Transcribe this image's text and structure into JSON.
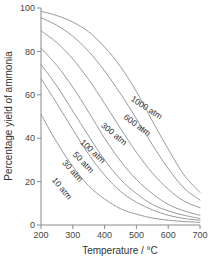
{
  "chart_data": {
    "type": "line",
    "title": "",
    "xlabel": "Temperature / °C",
    "ylabel": "Percentage yield of ammonia",
    "xlim": [
      200,
      700
    ],
    "ylim": [
      0,
      100
    ],
    "xticks": [
      200,
      300,
      400,
      500,
      600,
      700
    ],
    "yticks": [
      0,
      20,
      40,
      60,
      80,
      100
    ],
    "grid": false,
    "legend": "inline-curve-labels",
    "x": [
      200,
      250,
      300,
      350,
      400,
      450,
      500,
      550,
      600,
      650,
      700
    ],
    "series": [
      {
        "name": "1000 atm",
        "label": "1000 atm",
        "values": [
          98.5,
          96.5,
          93.5,
          89.0,
          82.0,
          73.0,
          61.5,
          48.0,
          35.0,
          23.0,
          15.0
        ]
      },
      {
        "name": "600 atm",
        "label": "600 atm",
        "values": [
          95.5,
          92.0,
          87.0,
          80.0,
          71.0,
          60.5,
          49.0,
          37.0,
          26.0,
          17.0,
          11.5
        ]
      },
      {
        "name": "300 atm",
        "label": "300 atm",
        "values": [
          89.5,
          84.0,
          76.5,
          67.0,
          56.0,
          44.5,
          33.5,
          24.0,
          16.5,
          11.0,
          8.0
        ]
      },
      {
        "name": "100 atm",
        "label": "100 atm",
        "values": [
          81.5,
          73.5,
          63.5,
          52.0,
          40.0,
          29.5,
          21.0,
          14.5,
          9.5,
          6.5,
          4.5
        ]
      },
      {
        "name": "50 atm",
        "label": "50 atm",
        "values": [
          74.0,
          64.0,
          52.5,
          41.0,
          30.0,
          21.0,
          14.5,
          9.5,
          6.5,
          4.5,
          3.0
        ]
      },
      {
        "name": "30 atm",
        "label": "30 atm",
        "values": [
          67.5,
          56.0,
          44.0,
          32.5,
          23.0,
          15.5,
          10.5,
          7.0,
          4.5,
          3.0,
          2.2
        ]
      },
      {
        "name": "10 atm",
        "label": "10 atm",
        "values": [
          51.0,
          38.0,
          27.0,
          18.0,
          12.0,
          7.5,
          5.0,
          3.2,
          2.2,
          1.6,
          1.2
        ]
      }
    ],
    "curve_label_positions": [
      {
        "name": "1000 atm",
        "x": 527,
        "y": 53,
        "rotation": 33
      },
      {
        "name": "600 atm",
        "x": 497,
        "y": 45,
        "rotation": 36
      },
      {
        "name": "300 atm",
        "x": 424,
        "y": 41,
        "rotation": 40
      },
      {
        "name": "100 atm",
        "x": 357,
        "y": 33,
        "rotation": 43
      },
      {
        "name": "50 atm",
        "x": 327,
        "y": 28,
        "rotation": 46
      },
      {
        "name": "30 atm",
        "x": 293,
        "y": 24,
        "rotation": 48
      },
      {
        "name": "10 atm",
        "x": 259,
        "y": 16,
        "rotation": 50
      }
    ]
  },
  "axis": {
    "x_title": "Temperature / °C",
    "y_title": "Percentage yield of ammonia",
    "x_tick_labels": [
      "200",
      "300",
      "400",
      "500",
      "600",
      "700"
    ],
    "y_tick_labels": [
      "0",
      "20",
      "40",
      "60",
      "80",
      "100"
    ]
  },
  "colors": {
    "curve": "#9a9a9a",
    "axis": "#8a8a8a",
    "text": "#333333",
    "background": "#ffffff"
  }
}
